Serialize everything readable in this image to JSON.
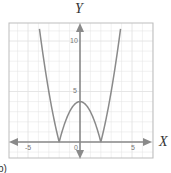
{
  "chart_data": {
    "type": "line",
    "title": "",
    "xlabel": "X",
    "ylabel": "Y",
    "function": "y = |x^2 - 4|",
    "xlim": [
      -7,
      7
    ],
    "ylim": [
      -1.6,
      11.8
    ],
    "grid": true,
    "x_ticks": [
      {
        "value": -5,
        "label": "-5"
      },
      {
        "value": 0,
        "label": "0"
      },
      {
        "value": 5,
        "label": "5"
      }
    ],
    "y_ticks": [
      {
        "value": 5,
        "label": "5"
      },
      {
        "value": 10,
        "label": "10"
      }
    ],
    "series": [
      {
        "name": "|x^2 - 4|",
        "x": [
          -4,
          -3.5,
          -3,
          -2.5,
          -2,
          -1.5,
          -1,
          -0.5,
          0,
          0.5,
          1,
          1.5,
          2,
          2.5,
          3,
          3.5,
          4
        ],
        "y": [
          12,
          8.25,
          5,
          2.25,
          0,
          1.75,
          3,
          3.75,
          4,
          3.75,
          3,
          1.75,
          0,
          2.25,
          5,
          8.25,
          12
        ]
      }
    ],
    "key_points": {
      "roots": [
        -2,
        2
      ],
      "local_max": {
        "x": 0,
        "y": 4
      }
    },
    "colors": {
      "curve": "#8a8a8a",
      "axes": "#8a8a8a",
      "grid": "#e3e3e3",
      "frame": "#bdbdbd"
    },
    "legend": null
  },
  "labels": {
    "x_axis": "X",
    "y_axis": "Y",
    "panel": "b)",
    "tick_neg5": "-5",
    "tick_0": "0",
    "tick_5": "5",
    "tick_y5": "5",
    "tick_y10": "10"
  }
}
